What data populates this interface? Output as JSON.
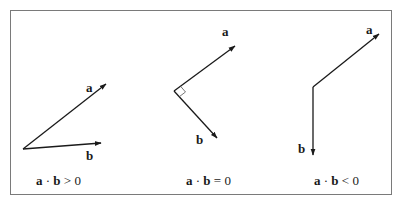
{
  "figure": {
    "stroke_color": "#1a1a1a",
    "border_color": "#7a7a7a",
    "panels": [
      {
        "id": "positive",
        "origin": [
          23,
          149
        ],
        "vector_a": {
          "label": "a",
          "tip": [
            106,
            83
          ],
          "label_pos": [
            87,
            91
          ]
        },
        "vector_b": {
          "label": "b",
          "tip": [
            100,
            143
          ],
          "label_pos": [
            87,
            160
          ]
        },
        "right_angle_marker": false,
        "caption": {
          "a": "a",
          "dot": "·",
          "b": "b",
          "relation": ">",
          "value": "0"
        }
      },
      {
        "id": "zero",
        "origin": [
          174,
          91
        ],
        "vector_a": {
          "label": "a",
          "tip": [
            235,
            45
          ],
          "label_pos": [
            222,
            38
          ]
        },
        "vector_b": {
          "label": "b",
          "tip": [
            217,
            139
          ],
          "label_pos": [
            196,
            142
          ]
        },
        "right_angle_marker": true,
        "caption": {
          "a": "a",
          "dot": "·",
          "b": "b",
          "relation": "=",
          "value": "0"
        }
      },
      {
        "id": "negative",
        "origin": [
          313,
          87
        ],
        "vector_a": {
          "label": "a",
          "tip": [
            379,
            33
          ],
          "label_pos": [
            366,
            35
          ]
        },
        "vector_b": {
          "label": "b",
          "tip": [
            313,
            155
          ],
          "label_pos": [
            298,
            155
          ]
        },
        "right_angle_marker": false,
        "caption": {
          "a": "a",
          "dot": "·",
          "b": "b",
          "relation": "<",
          "value": "0"
        }
      }
    ]
  }
}
